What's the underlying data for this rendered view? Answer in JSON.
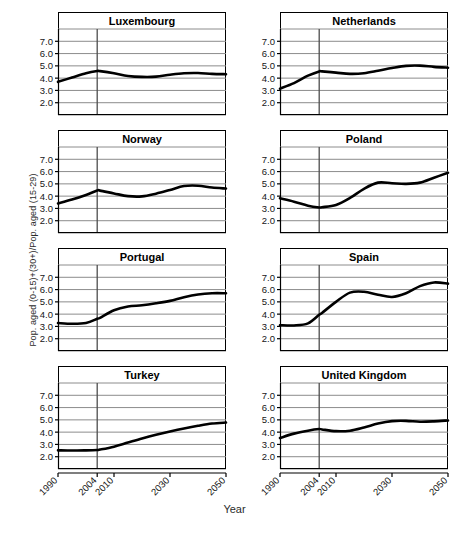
{
  "chart_data": {
    "type": "line",
    "title": "",
    "xlabel": "Year",
    "ylabel": "Pop. aged (0-15)+(30+)/Pop. aged (15-29)",
    "layout": {
      "rows": 4,
      "cols": 2,
      "grid": true,
      "legend": "none",
      "shared_axes": true,
      "marker_line_year": 2004,
      "marker_line_description": "vertical reference line at 2004"
    },
    "xlim": [
      1990,
      2050
    ],
    "ylim": [
      1.0,
      8.0
    ],
    "ytick_labels": [
      "2.0",
      "3.0",
      "4.0",
      "5.0",
      "6.0",
      "7.0"
    ],
    "ytick_values": [
      2.0,
      3.0,
      4.0,
      5.0,
      6.0,
      7.0
    ],
    "gridline_values": [
      1.0,
      2.0,
      3.0,
      4.0,
      5.0,
      6.0,
      7.0,
      8.0
    ],
    "xtick_labels": [
      "1990",
      "2004",
      "2010",
      "2030",
      "2050"
    ],
    "xtick_values": [
      1990,
      2004,
      2010,
      2030,
      2050
    ],
    "x": [
      1990,
      1995,
      2000,
      2004,
      2005,
      2010,
      2015,
      2020,
      2025,
      2030,
      2035,
      2040,
      2045,
      2050
    ],
    "panels": [
      {
        "name": "Luxembourg",
        "values": [
          3.7,
          4.05,
          4.4,
          4.58,
          4.57,
          4.4,
          4.18,
          4.1,
          4.12,
          4.28,
          4.4,
          4.42,
          4.35,
          4.32
        ]
      },
      {
        "name": "Netherlands",
        "values": [
          3.15,
          3.6,
          4.2,
          4.55,
          4.55,
          4.45,
          4.35,
          4.4,
          4.6,
          4.82,
          5.0,
          5.02,
          4.92,
          4.85
        ]
      },
      {
        "name": "Norway",
        "values": [
          3.4,
          3.72,
          4.1,
          4.45,
          4.45,
          4.22,
          4.0,
          3.98,
          4.2,
          4.5,
          4.82,
          4.85,
          4.7,
          4.62
        ]
      },
      {
        "name": "Poland",
        "values": [
          3.82,
          3.55,
          3.22,
          3.08,
          3.1,
          3.28,
          3.85,
          4.6,
          5.1,
          5.05,
          5.0,
          5.1,
          5.5,
          5.9
        ]
      },
      {
        "name": "Portugal",
        "values": [
          3.28,
          3.22,
          3.28,
          3.62,
          3.7,
          4.32,
          4.62,
          4.72,
          4.88,
          5.08,
          5.38,
          5.6,
          5.7,
          5.7
        ]
      },
      {
        "name": "Spain",
        "values": [
          3.1,
          3.08,
          3.25,
          3.95,
          4.1,
          5.0,
          5.75,
          5.82,
          5.58,
          5.4,
          5.7,
          6.28,
          6.58,
          6.48
        ]
      },
      {
        "name": "Turkey",
        "values": [
          2.52,
          2.5,
          2.52,
          2.55,
          2.58,
          2.82,
          3.15,
          3.48,
          3.78,
          4.05,
          4.3,
          4.52,
          4.7,
          4.78
        ]
      },
      {
        "name": "United Kingdom",
        "values": [
          3.52,
          3.88,
          4.12,
          4.25,
          4.22,
          4.08,
          4.12,
          4.38,
          4.7,
          4.9,
          4.92,
          4.85,
          4.88,
          4.95
        ]
      }
    ],
    "colors": {
      "series_line": "#000000",
      "gridline": "#8c8c8c",
      "axis": "#000000",
      "marker_line": "#4d4d4d",
      "background": "#ffffff"
    }
  }
}
